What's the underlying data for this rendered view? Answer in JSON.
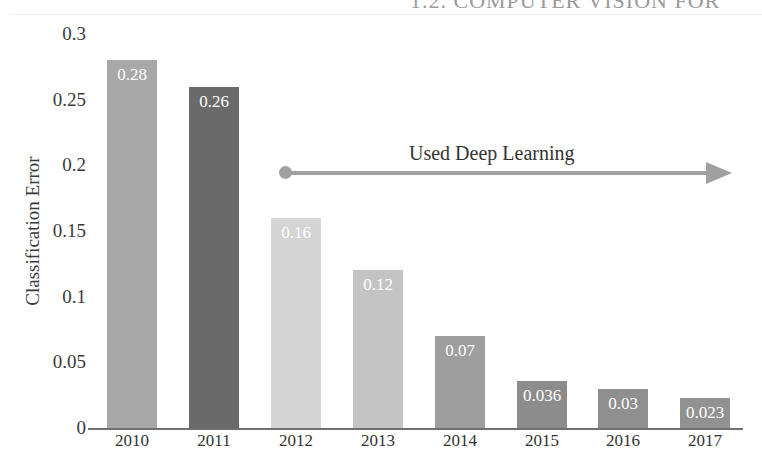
{
  "page_header": "1.2. COMPUTER VISION FOR",
  "chart_data": {
    "type": "bar",
    "title": "",
    "xlabel": "",
    "ylabel": "Classification Error",
    "categories": [
      "2010",
      "2011",
      "2012",
      "2013",
      "2014",
      "2015",
      "2016",
      "2017"
    ],
    "values": [
      0.28,
      0.26,
      0.16,
      0.12,
      0.07,
      0.036,
      0.03,
      0.023
    ],
    "value_labels": [
      "0.28",
      "0.26",
      "0.16",
      "0.12",
      "0.07",
      "0.036",
      "0.03",
      "0.023"
    ],
    "bar_colors": [
      "#a8a8a8",
      "#6a6a6a",
      "#d4d4d4",
      "#c4c4c4",
      "#9e9e9e",
      "#8c8c8c",
      "#8f8f8f",
      "#919191"
    ],
    "ylim": [
      0,
      0.3
    ],
    "yticks": [
      "0",
      "0.05",
      "0.1",
      "0.15",
      "0.2",
      "0.25",
      "0.3"
    ],
    "grid": false,
    "legend": null,
    "annotations": [
      {
        "text": "Used Deep Learning",
        "type": "arrow",
        "from_category": "2012",
        "to_category": "2017",
        "y": 0.195,
        "color": "#a0a0a0"
      }
    ]
  }
}
